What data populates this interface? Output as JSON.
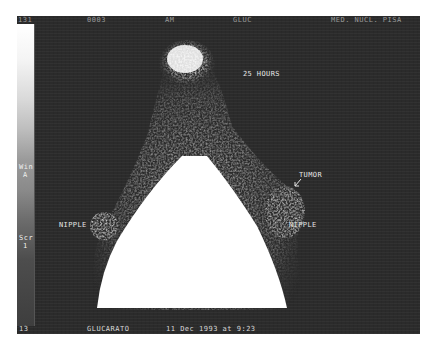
{
  "header": {
    "frame_no": "131",
    "study_id": "0003",
    "mode": "AM",
    "agent": "GLUC",
    "institution": "MED. NUCL. PISA"
  },
  "colorbar": {
    "max": "131",
    "label_line1": "Win",
    "label_line2": "A",
    "scr_line1": "Scr",
    "scr_line2": "1",
    "min": "13"
  },
  "annotations": {
    "time": "25 HOURS",
    "tumor": "TUMOR",
    "nipple_left": "NIPPLE",
    "nipple_right": "NIPPLE"
  },
  "footer": {
    "min_value": "13",
    "agent": "GLUCARATO",
    "date": "11 Dec 1993 at  9:23"
  }
}
